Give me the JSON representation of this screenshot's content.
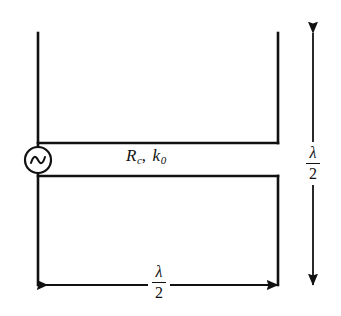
{
  "figure": {
    "name": "half-wave-transmission-line-antenna",
    "background_color": "#ffffff",
    "ink_color": "#111111",
    "width": 341,
    "height": 316
  },
  "source": {
    "symbol_name": "ac-source",
    "shape": "circle-with-sine-wave",
    "center_x": 38,
    "center_y": 160,
    "radius": 13
  },
  "labels": {
    "line_constants": {
      "resistance_symbol": "R",
      "resistance_subscript": "c",
      "separator": ",",
      "wavenumber_symbol": "k",
      "wavenumber_subscript": "0",
      "plain_text": "R_c, k_0"
    },
    "bottom_dimension": {
      "numerator": "λ",
      "denominator": "2",
      "plain_text": "λ/2"
    },
    "right_dimension": {
      "numerator": "λ",
      "denominator": "2",
      "plain_text": "λ/2"
    }
  },
  "geometry": {
    "left_conductor_x": 38,
    "right_conductor_x": 278,
    "top_y": 33,
    "upper_line_y": 143,
    "lower_line_y": 176,
    "bottom_y": 285,
    "right_dimension_x": 313
  }
}
